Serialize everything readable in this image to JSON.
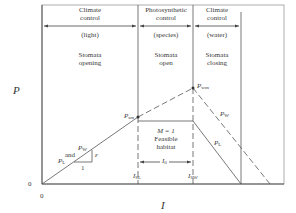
{
  "axes": {
    "y_label": "P",
    "x_label": "I",
    "x_origin": "0",
    "y_origin": "0"
  },
  "zones": [
    {
      "title_line1": "Climate",
      "title_line2": "control",
      "subtitle": "(light)",
      "stomata_line1": "Stomata",
      "stomata_line2": "opening"
    },
    {
      "title_line1": "Photosynthetic",
      "title_line2": "control",
      "subtitle": "(species)",
      "stomata_line1": "Stomata",
      "stomata_line2": "open"
    },
    {
      "title_line1": "Climate",
      "title_line2": "control",
      "subtitle": "(water)",
      "stomata_line1": "Stomata",
      "stomata_line2": "closing"
    }
  ],
  "points": {
    "psm": {
      "main": "P",
      "sub": "sm"
    },
    "pwm": {
      "main": "P",
      "sub": "wm"
    }
  },
  "lines": {
    "pw": {
      "main": "P",
      "sub": "W"
    },
    "pl": {
      "main": "P",
      "sub": "L"
    },
    "pl_left": {
      "main": "P",
      "sub": "L"
    },
    "pw_left": {
      "main": "P",
      "sub": "W"
    },
    "and_text": "and",
    "slope_epsilon": "ε",
    "slope_one": "1"
  },
  "habitat": {
    "line1": "M = 1",
    "line2": "Feasible",
    "line3": "habitat",
    "width_label": {
      "main": "I",
      "sub": "0"
    }
  },
  "ticks": {
    "isl": {
      "main": "I",
      "sub": "SL"
    },
    "isw": {
      "main": "I",
      "sub": "SW"
    }
  },
  "colors": {
    "line": "#555555",
    "text": "#3a3a3a",
    "background": "#ffffff"
  }
}
